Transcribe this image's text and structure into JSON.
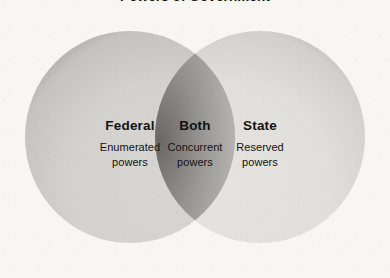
{
  "title": "Powers of Government",
  "diagram": {
    "type": "venn",
    "sets": [
      {
        "id": "federal",
        "heading": "Federal",
        "description_lines": [
          "Enumerated",
          "powers"
        ],
        "fill": "#d6d5d2",
        "edge": "#141312"
      },
      {
        "id": "both",
        "heading": "Both",
        "description_lines": [
          "Concurrent",
          "powers"
        ],
        "fill": "#c4c3c0",
        "edge": "#565553"
      },
      {
        "id": "state",
        "heading": "State",
        "description_lines": [
          "Reserved",
          "powers"
        ],
        "fill": "#e4e3e0",
        "edge": "#201f1e"
      }
    ],
    "background": "#f7f6f3",
    "text_color": "#141210"
  }
}
